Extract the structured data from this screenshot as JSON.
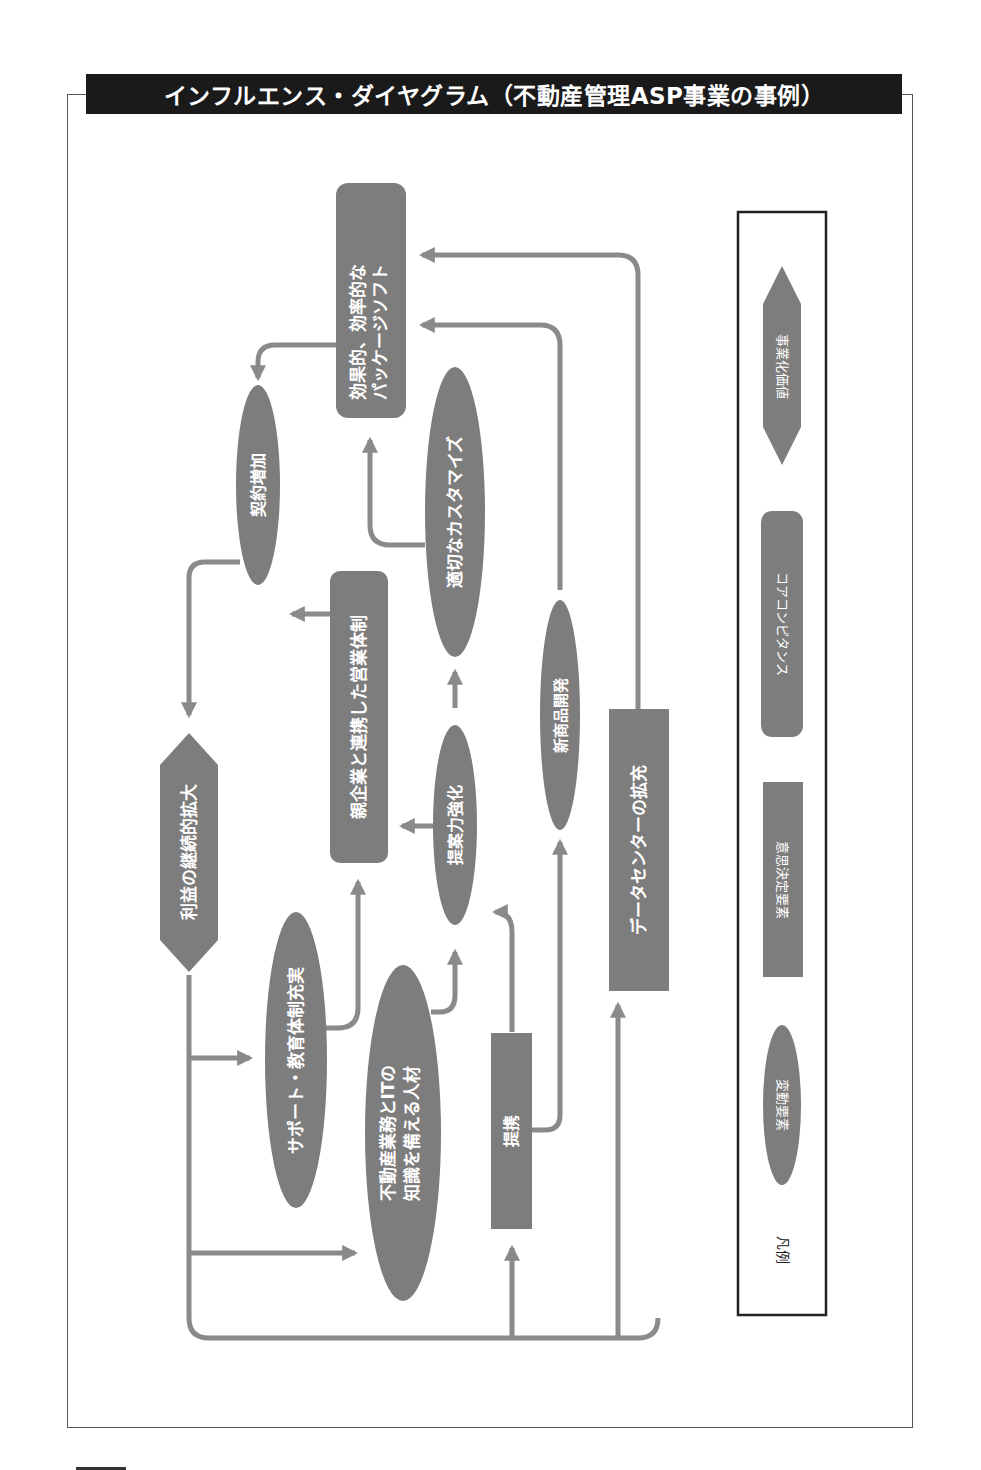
{
  "title": "インフルエンス・ダイヤグラム（不動産管理ASP事業の事例）",
  "colors": {
    "node_fill": "#7d7d7d",
    "arrow": "#8a8a8a",
    "title_bg": "#1a1a1a",
    "frame": "#555555"
  },
  "nodes": {
    "efficient_package": {
      "type": "core_competence",
      "lines": [
        "効果的、効率的な",
        "パッケージソフト"
      ]
    },
    "contract_increase": {
      "type": "variable",
      "lines": [
        "契約増加"
      ]
    },
    "parent_partnership_sales": {
      "type": "core_competence",
      "lines": [
        "親企業と連携した営業体制"
      ]
    },
    "proper_customize": {
      "type": "variable",
      "lines": [
        "適切なカスタマイズ"
      ]
    },
    "profit_expansion": {
      "type": "business_value",
      "lines": [
        "利益の継続的拡大"
      ]
    },
    "proposal_strength": {
      "type": "variable",
      "lines": [
        "提案力強化"
      ]
    },
    "new_product_dev": {
      "type": "variable",
      "lines": [
        "新商品開発"
      ]
    },
    "datacenter_expansion": {
      "type": "decision",
      "lines": [
        "データセンターの拡充"
      ]
    },
    "support_education": {
      "type": "variable",
      "lines": [
        "サポート・教育体制充実"
      ]
    },
    "realestate_it_talent": {
      "type": "variable",
      "lines": [
        "不動産業務とITの",
        "知識を備える人材"
      ]
    },
    "alliance": {
      "type": "decision",
      "lines": [
        "提携"
      ]
    }
  },
  "edges": [
    {
      "from": "efficient_package",
      "to": "contract_increase"
    },
    {
      "from": "contract_increase",
      "to": "profit_expansion"
    },
    {
      "from": "parent_partnership_sales",
      "to": "contract_increase"
    },
    {
      "from": "proper_customize",
      "to": "efficient_package"
    },
    {
      "from": "proposal_strength",
      "to": "proper_customize"
    },
    {
      "from": "proposal_strength",
      "to": "parent_partnership_sales"
    },
    {
      "from": "new_product_dev",
      "to": "efficient_package"
    },
    {
      "from": "datacenter_expansion",
      "to": "efficient_package"
    },
    {
      "from": "support_education",
      "to": "parent_partnership_sales"
    },
    {
      "from": "realestate_it_talent",
      "to": "proposal_strength"
    },
    {
      "from": "alliance",
      "to": "proposal_strength"
    },
    {
      "from": "alliance",
      "to": "new_product_dev"
    },
    {
      "from": "profit_expansion",
      "to": "support_education"
    },
    {
      "from": "profit_expansion",
      "to": "realestate_it_talent"
    },
    {
      "from": "profit_expansion",
      "to": "alliance"
    },
    {
      "from": "profit_expansion",
      "to": "datacenter_expansion"
    }
  ],
  "legend": {
    "title": "凡例",
    "items": [
      {
        "shape": "hexagon",
        "label": "事業化価値"
      },
      {
        "shape": "rounded-rect",
        "label": "コアコンピタンス"
      },
      {
        "shape": "rect",
        "label": "意思決定要素"
      },
      {
        "shape": "ellipse",
        "label": "変動要素"
      }
    ]
  }
}
